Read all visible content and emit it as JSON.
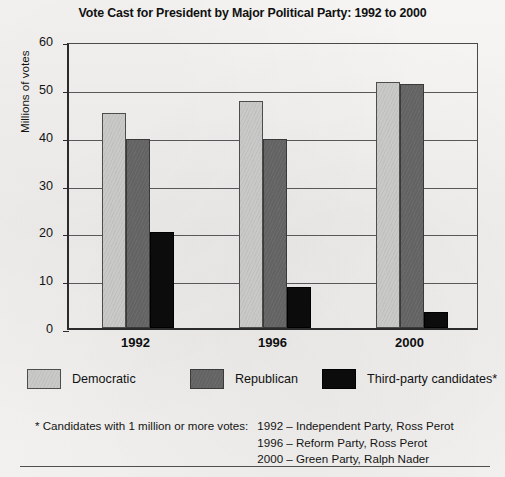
{
  "chart_data": {
    "type": "bar",
    "title": "Vote Cast for President by Major Political Party: 1992 to 2000",
    "categories": [
      "1992",
      "1996",
      "2000"
    ],
    "series": [
      {
        "name": "Democratic",
        "color": "#c9c9c7",
        "values": [
          45.0,
          47.5,
          51.5
        ]
      },
      {
        "name": "Republican",
        "color": "#636363",
        "values": [
          39.5,
          39.5,
          51.0
        ]
      },
      {
        "name": "Third-party candidates*",
        "color": "#0c0c0c",
        "values": [
          20.0,
          8.5,
          3.3
        ]
      }
    ],
    "xlabel": "",
    "ylabel": "Millions of votes",
    "ylim": [
      0,
      60
    ],
    "ytick_step": 10,
    "yticks": [
      "0",
      "10",
      "20",
      "30",
      "40",
      "50",
      "60"
    ],
    "grid": "horizontal",
    "legend_position": "below-plot"
  },
  "legend": {
    "items": [
      {
        "label": "Democratic",
        "swatch": "dem"
      },
      {
        "label": "Republican",
        "swatch": "rep"
      },
      {
        "label": "Third-party candidates*",
        "swatch": "third"
      }
    ]
  },
  "footnote": {
    "lead": "* Candidates with 1 million or more votes:",
    "lines": [
      "1992 – Independent Party, Ross Perot",
      "1996 – Reform Party, Ross Perot",
      "2000 – Green Party, Ralph Nader"
    ]
  }
}
